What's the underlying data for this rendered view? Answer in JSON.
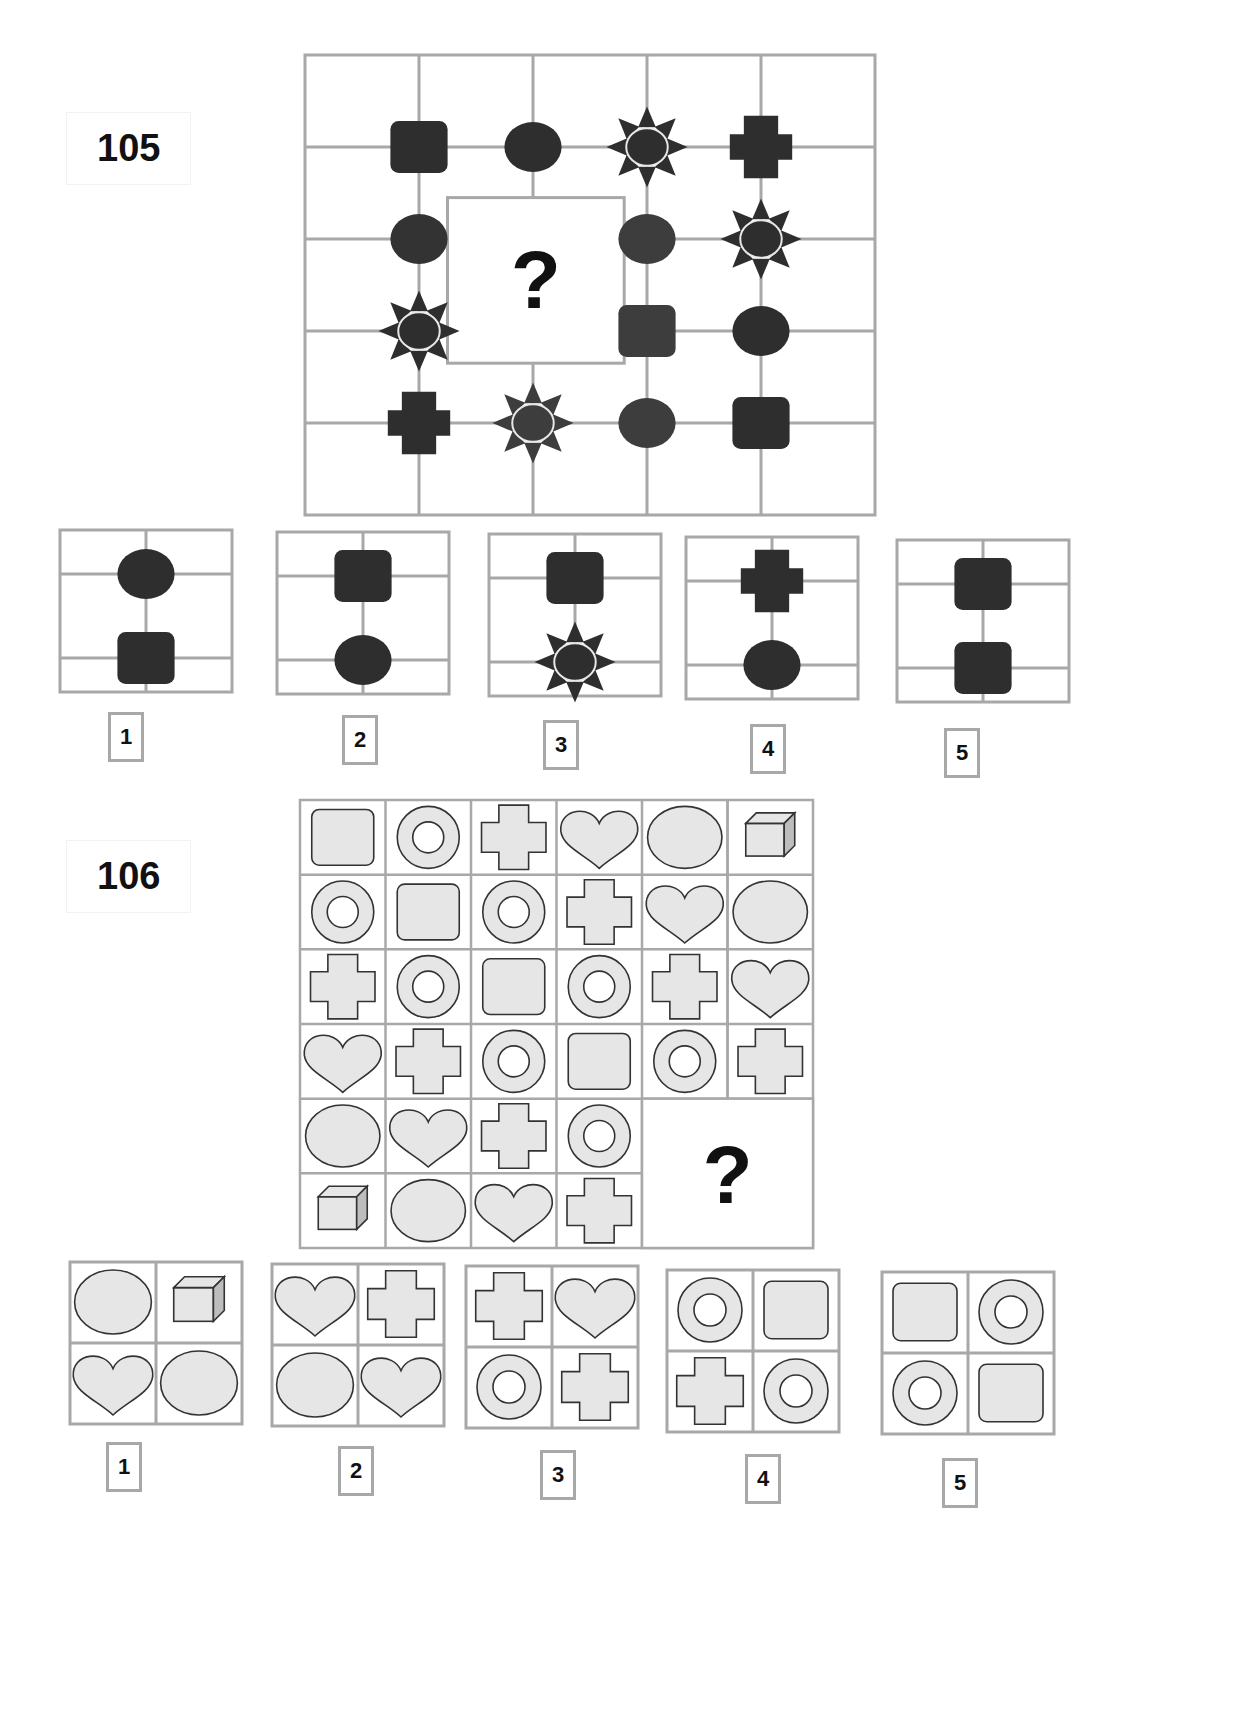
{
  "puzzles": [
    {
      "number": "105",
      "question_mark": "?",
      "grid": {
        "rows": 5,
        "cols": 5,
        "shapes": [
          {
            "row": 1,
            "col": 1,
            "shape": "rounded-square",
            "fill": "#2e2e2e"
          },
          {
            "row": 1,
            "col": 2,
            "shape": "ellipse",
            "fill": "#2e2e2e"
          },
          {
            "row": 1,
            "col": 3,
            "shape": "sun",
            "fill": "#2e2e2e"
          },
          {
            "row": 1,
            "col": 4,
            "shape": "cross",
            "fill": "#2e2e2e"
          },
          {
            "row": 2,
            "col": 1,
            "shape": "ellipse",
            "fill": "#333333"
          },
          {
            "row": 2,
            "col": 3,
            "shape": "ellipse",
            "fill": "#3d3d3d"
          },
          {
            "row": 2,
            "col": 4,
            "shape": "sun",
            "fill": "#2e2e2e"
          },
          {
            "row": 3,
            "col": 1,
            "shape": "sun",
            "fill": "#2e2e2e"
          },
          {
            "row": 3,
            "col": 3,
            "shape": "rounded-square",
            "fill": "#3d3d3d"
          },
          {
            "row": 3,
            "col": 4,
            "shape": "ellipse",
            "fill": "#2e2e2e"
          },
          {
            "row": 4,
            "col": 1,
            "shape": "cross",
            "fill": "#2e2e2e"
          },
          {
            "row": 4,
            "col": 2,
            "shape": "sun",
            "fill": "#3d3d3d"
          },
          {
            "row": 4,
            "col": 3,
            "shape": "ellipse",
            "fill": "#3d3d3d"
          },
          {
            "row": 4,
            "col": 4,
            "shape": "rounded-square",
            "fill": "#2e2e2e"
          }
        ]
      },
      "options": [
        {
          "label": "1",
          "top": "ellipse",
          "bottom": "rounded-square"
        },
        {
          "label": "2",
          "top": "rounded-square",
          "bottom": "ellipse"
        },
        {
          "label": "3",
          "top": "rounded-square",
          "bottom": "sun"
        },
        {
          "label": "4",
          "top": "cross",
          "bottom": "ellipse"
        },
        {
          "label": "5",
          "top": "rounded-square",
          "bottom": "rounded-square"
        }
      ]
    },
    {
      "number": "106",
      "question_mark": "?",
      "grid": {
        "rows": 6,
        "cols": 6,
        "cells": [
          [
            "rounded-square",
            "ring",
            "cross",
            "heart",
            "ellipse",
            "cube"
          ],
          [
            "ring",
            "rounded-square",
            "ring",
            "cross",
            "heart",
            "ellipse"
          ],
          [
            "cross",
            "ring",
            "rounded-square",
            "ring",
            "cross",
            "heart"
          ],
          [
            "heart",
            "cross",
            "ring",
            "rounded-square",
            "ring",
            "cross"
          ],
          [
            "ellipse",
            "heart",
            "cross",
            "ring",
            "?",
            "?"
          ],
          [
            "cube",
            "ellipse",
            "heart",
            "cross",
            "?",
            "?"
          ]
        ]
      },
      "options": [
        {
          "label": "1",
          "cells": [
            "ellipse",
            "cube",
            "heart",
            "ellipse"
          ]
        },
        {
          "label": "2",
          "cells": [
            "heart",
            "cross",
            "ellipse",
            "heart"
          ]
        },
        {
          "label": "3",
          "cells": [
            "cross",
            "heart",
            "ring",
            "cross"
          ]
        },
        {
          "label": "4",
          "cells": [
            "ring",
            "rounded-square",
            "cross",
            "ring"
          ]
        },
        {
          "label": "5",
          "cells": [
            "rounded-square",
            "ring",
            "ring",
            "rounded-square"
          ]
        }
      ]
    }
  ],
  "colors": {
    "grid_line": "#a8a8a8",
    "dark_shape": "#2e2e2e",
    "light_shape_fill": "#e6e6e6",
    "light_shape_stroke": "#333333"
  }
}
